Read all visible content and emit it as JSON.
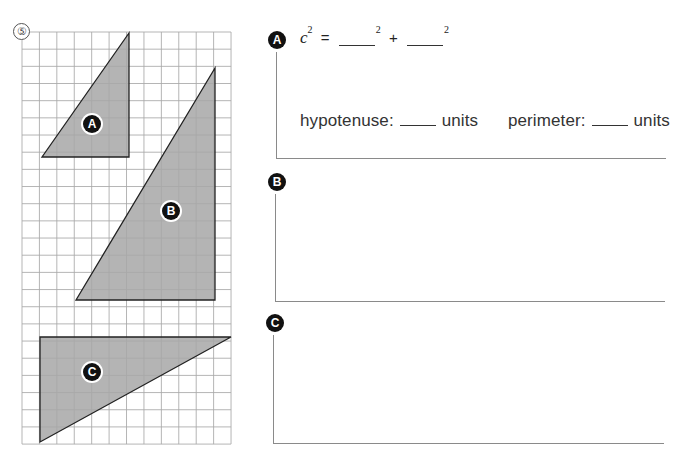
{
  "problem": {
    "number": "5",
    "number_glyph": "⑤"
  },
  "grid": {
    "left": 22,
    "top": 32,
    "cols": 12,
    "rows": 24,
    "cell_w": 17.42,
    "cell_h": 17.17,
    "line_color": "#a9a9a9",
    "fill_color": "#b4b4b4",
    "stroke_color": "#222222"
  },
  "triangles": [
    {
      "label": "A",
      "points": [
        [
          129,
          33
        ],
        [
          42,
          157
        ],
        [
          129,
          157
        ]
      ],
      "badge": [
        92,
        124
      ],
      "legs_cells": [
        5,
        7
      ]
    },
    {
      "label": "B",
      "points": [
        [
          215,
          68
        ],
        [
          76,
          300
        ],
        [
          215,
          300
        ]
      ],
      "badge": [
        171,
        211
      ],
      "legs_cells": [
        8,
        13
      ]
    },
    {
      "label": "C",
      "points": [
        [
          40,
          337
        ],
        [
          231,
          337
        ],
        [
          40,
          442
        ]
      ],
      "badge": [
        92,
        372
      ],
      "legs_cells": [
        11,
        6
      ]
    }
  ],
  "sections": [
    {
      "label": "A",
      "badge": [
        277,
        40
      ],
      "box": {
        "left": 276,
        "top": 52,
        "right": 665,
        "bottom": 158
      },
      "equation": {
        "lhs_var": "c",
        "exp": "2",
        "equals": "=",
        "plus": "+"
      },
      "hypotenuse": {
        "label": "hypotenuse:",
        "unit": "units"
      },
      "perimeter": {
        "label": "perimeter:",
        "unit": "units"
      }
    },
    {
      "label": "B",
      "badge": [
        277,
        182
      ],
      "box": {
        "left": 275,
        "top": 194,
        "right": 664,
        "bottom": 301
      }
    },
    {
      "label": "C",
      "badge": [
        275,
        323
      ],
      "box": {
        "left": 273,
        "top": 335,
        "right": 663,
        "bottom": 443
      }
    }
  ]
}
